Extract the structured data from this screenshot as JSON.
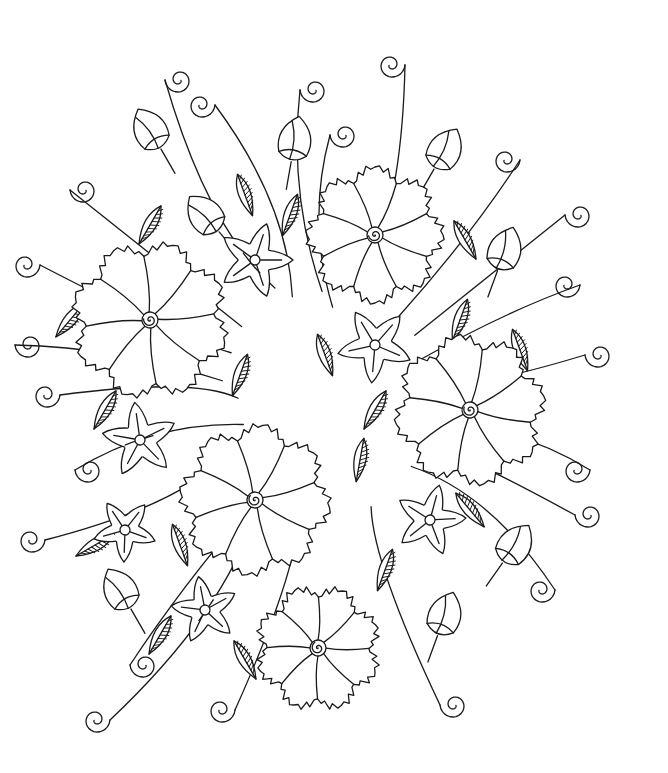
{
  "image": {
    "kind": "coloring-page line art",
    "subject": "floral bouquet",
    "background": "#ffffff",
    "line_color": "#1a1a1a",
    "width": 668,
    "height": 773
  },
  "elements": {
    "large_ruffled_flowers": [
      {
        "cx": 375,
        "cy": 235,
        "r": 68
      },
      {
        "cx": 150,
        "cy": 320,
        "r": 78
      },
      {
        "cx": 470,
        "cy": 410,
        "r": 75
      },
      {
        "cx": 255,
        "cy": 500,
        "r": 75
      },
      {
        "cx": 318,
        "cy": 648,
        "r": 62
      }
    ],
    "star_flowers": [
      {
        "cx": 255,
        "cy": 260,
        "r": 38
      },
      {
        "cx": 375,
        "cy": 345,
        "r": 38
      },
      {
        "cx": 140,
        "cy": 440,
        "r": 38
      },
      {
        "cx": 430,
        "cy": 520,
        "r": 36
      },
      {
        "cx": 125,
        "cy": 530,
        "r": 32
      },
      {
        "cx": 205,
        "cy": 610,
        "r": 34
      }
    ],
    "buds": [
      {
        "x": 150,
        "y": 130,
        "rot": -30
      },
      {
        "x": 295,
        "y": 140,
        "rot": 10
      },
      {
        "x": 445,
        "y": 150,
        "rot": 30
      },
      {
        "x": 505,
        "y": 250,
        "rot": 20
      },
      {
        "x": 205,
        "y": 215,
        "rot": -40
      },
      {
        "x": 515,
        "y": 545,
        "rot": 35
      },
      {
        "x": 120,
        "y": 590,
        "rot": -30
      },
      {
        "x": 445,
        "y": 615,
        "rot": 20
      }
    ],
    "curl_tendrils": [
      {
        "x": 165,
        "y": 80
      },
      {
        "x": 215,
        "y": 105
      },
      {
        "x": 300,
        "y": 90
      },
      {
        "x": 405,
        "y": 65
      },
      {
        "x": 330,
        "y": 135
      },
      {
        "x": 520,
        "y": 160
      },
      {
        "x": 565,
        "y": 215
      },
      {
        "x": 580,
        "y": 285
      },
      {
        "x": 70,
        "y": 190
      },
      {
        "x": 40,
        "y": 265
      },
      {
        "x": 15,
        "y": 345
      },
      {
        "x": 60,
        "y": 395
      },
      {
        "x": 585,
        "y": 355
      },
      {
        "x": 590,
        "y": 470
      },
      {
        "x": 575,
        "y": 515
      },
      {
        "x": 45,
        "y": 540
      },
      {
        "x": 75,
        "y": 470
      },
      {
        "x": 555,
        "y": 590
      },
      {
        "x": 130,
        "y": 665
      },
      {
        "x": 235,
        "y": 710
      },
      {
        "x": 440,
        "y": 705
      },
      {
        "x": 110,
        "y": 720
      }
    ],
    "hatched_leaves": [
      {
        "x": 150,
        "y": 225,
        "rot": 30
      },
      {
        "x": 245,
        "y": 195,
        "rot": -20
      },
      {
        "x": 290,
        "y": 215,
        "rot": 20
      },
      {
        "x": 465,
        "y": 240,
        "rot": -30
      },
      {
        "x": 70,
        "y": 320,
        "rot": 40
      },
      {
        "x": 105,
        "y": 410,
        "rot": 30
      },
      {
        "x": 325,
        "y": 355,
        "rot": -20
      },
      {
        "x": 240,
        "y": 375,
        "rot": 20
      },
      {
        "x": 460,
        "y": 320,
        "rot": 20
      },
      {
        "x": 520,
        "y": 350,
        "rot": -20
      },
      {
        "x": 360,
        "y": 460,
        "rot": 10
      },
      {
        "x": 95,
        "y": 545,
        "rot": 60
      },
      {
        "x": 160,
        "y": 635,
        "rot": 30
      },
      {
        "x": 245,
        "y": 660,
        "rot": -30
      },
      {
        "x": 385,
        "y": 570,
        "rot": 20
      },
      {
        "x": 470,
        "y": 510,
        "rot": -40
      },
      {
        "x": 180,
        "y": 545,
        "rot": -20
      },
      {
        "x": 375,
        "y": 410,
        "rot": 30
      }
    ]
  }
}
